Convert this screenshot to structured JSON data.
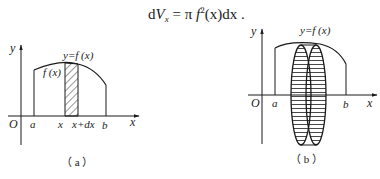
{
  "formula": {
    "d": "d",
    "V": "V",
    "V_sub": "x",
    "eq": " = π ",
    "f": "f",
    "sup": "2",
    "arg": "(x)dx ."
  },
  "figure_a": {
    "axis_y_label": "y",
    "axis_x_label": "x",
    "origin": "O",
    "curve_label": "y=f (x)",
    "height_label": "f (x)",
    "tick_a": "a",
    "tick_x": "x",
    "tick_x_dx": "x+dx",
    "tick_b": "b",
    "caption": "（ a ）"
  },
  "figure_b": {
    "axis_y_label": "y",
    "axis_x_label": "x",
    "origin": "O",
    "curve_label": "y=f (x)",
    "tick_a": "a",
    "tick_b": "b",
    "caption": "（ b ）"
  },
  "colors": {
    "ink": "#1a1a1a",
    "background": "#ffffff"
  }
}
